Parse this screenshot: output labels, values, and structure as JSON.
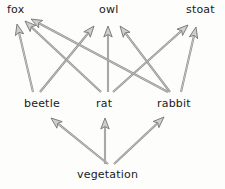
{
  "diagram": {
    "type": "food-web",
    "background_color": "#fdfdfb",
    "arrow_fill_color": "#cfcfcf",
    "arrow_outline_color": "#7d7d7d",
    "text_color": "#1a1a1a",
    "nodes": [
      {
        "id": "fox",
        "label": "fox",
        "row": "top",
        "x": 7,
        "y": 4
      },
      {
        "id": "owl",
        "label": "owl",
        "row": "top",
        "x": 99,
        "y": 4
      },
      {
        "id": "stoat",
        "label": "stoat",
        "row": "top",
        "x": 186,
        "y": 4
      },
      {
        "id": "beetle",
        "label": "beetle",
        "row": "middle",
        "x": 24,
        "y": 98
      },
      {
        "id": "rat",
        "label": "rat",
        "row": "middle",
        "x": 96,
        "y": 98
      },
      {
        "id": "rabbit",
        "label": "rabbit",
        "row": "middle",
        "x": 157,
        "y": 98
      },
      {
        "id": "vegetation",
        "label": "vegetation",
        "row": "bottom",
        "x": 77,
        "y": 169
      }
    ],
    "edges": [
      {
        "from": "beetle",
        "to": "fox",
        "x1": 33,
        "y1": 92,
        "x2": 17,
        "y2": 24
      },
      {
        "from": "beetle",
        "to": "owl",
        "x1": 40,
        "y1": 92,
        "x2": 94,
        "y2": 26
      },
      {
        "from": "rat",
        "to": "fox",
        "x1": 101,
        "y1": 92,
        "x2": 25,
        "y2": 21
      },
      {
        "from": "rat",
        "to": "owl",
        "x1": 108,
        "y1": 92,
        "x2": 108,
        "y2": 26
      },
      {
        "from": "rat",
        "to": "stoat",
        "x1": 113,
        "y1": 92,
        "x2": 188,
        "y2": 25
      },
      {
        "from": "rabbit",
        "to": "fox",
        "x1": 168,
        "y1": 92,
        "x2": 31,
        "y2": 19
      },
      {
        "from": "rabbit",
        "to": "owl",
        "x1": 170,
        "y1": 92,
        "x2": 120,
        "y2": 26
      },
      {
        "from": "rabbit",
        "to": "stoat",
        "x1": 181,
        "y1": 92,
        "x2": 196,
        "y2": 27
      },
      {
        "from": "vegetation",
        "to": "beetle",
        "x1": 108,
        "y1": 164,
        "x2": 51,
        "y2": 118
      },
      {
        "from": "vegetation",
        "to": "rat",
        "x1": 105,
        "y1": 164,
        "x2": 105,
        "y2": 118
      },
      {
        "from": "vegetation",
        "to": "rabbit",
        "x1": 114,
        "y1": 164,
        "x2": 164,
        "y2": 117
      }
    ]
  }
}
